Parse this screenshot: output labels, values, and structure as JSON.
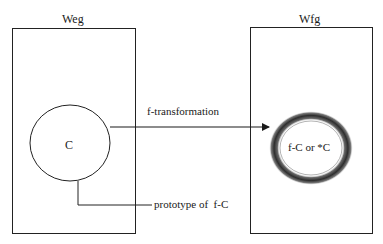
{
  "diagram": {
    "left_box": {
      "title": "Weg"
    },
    "right_box": {
      "title": "Wfg"
    },
    "source_node": {
      "label": "C"
    },
    "target_node": {
      "label": "f-C or *C"
    },
    "arrow": {
      "label": "f-transformation"
    },
    "connector": {
      "label": "prototype of  f-C"
    },
    "colors": {
      "line": "#222222",
      "ring_dark": "#3a3a3a",
      "ring_light": "#9a9a9a",
      "background": "#ffffff"
    }
  }
}
